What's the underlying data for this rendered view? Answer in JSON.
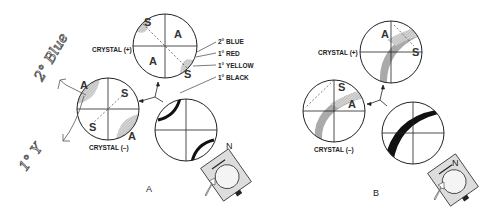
{
  "panels": [
    {
      "id": "A",
      "label": "A",
      "crystal_plus": {
        "label": "CRYSTAL (+)",
        "quadrants": [
          "S",
          "A",
          "A",
          "S"
        ]
      },
      "crystal_minus": {
        "label": "CRYSTAL (–)",
        "quadrants": [
          "A",
          "S",
          "S",
          "A"
        ]
      },
      "legend": [
        "2° BLUE",
        "1° RED",
        "1° YELLOW",
        "1° BLACK"
      ],
      "handwritten": [
        "2° Blue",
        "1° Y"
      ]
    },
    {
      "id": "B",
      "label": "B",
      "crystal_plus": {
        "label": "CRYSTAL (+)",
        "quadrants": [
          "A",
          "S"
        ]
      },
      "crystal_minus": {
        "label": "CRYSTAL (–)",
        "quadrants": [
          "S",
          "A"
        ]
      }
    }
  ],
  "compass": {
    "north_label": "N"
  }
}
